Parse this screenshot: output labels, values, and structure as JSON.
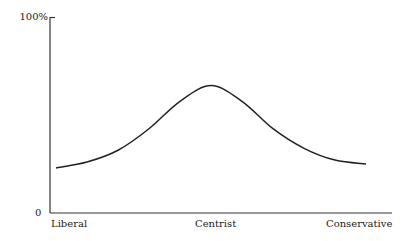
{
  "chart_data": {
    "type": "line",
    "title": "",
    "xlabel": "",
    "ylabel": "",
    "x_tick_labels": [
      "Liberal",
      "Centrist",
      "Conservative"
    ],
    "y_tick_labels": [
      "0",
      "100%"
    ],
    "ylim": [
      0,
      100
    ],
    "grid": false,
    "legend": null,
    "series": [
      {
        "name": "distribution",
        "x": [
          0,
          0.1,
          0.2,
          0.3,
          0.4,
          0.5,
          0.6,
          0.7,
          0.8,
          0.9,
          1.0
        ],
        "values": [
          23,
          26,
          32,
          43,
          57,
          65,
          57,
          43,
          33,
          27,
          25
        ]
      }
    ]
  },
  "axis": {
    "y_top_label": "100%",
    "y_bottom_label": "0",
    "x_left_label": "Liberal",
    "x_center_label": "Centrist",
    "x_right_label": "Conservative"
  }
}
